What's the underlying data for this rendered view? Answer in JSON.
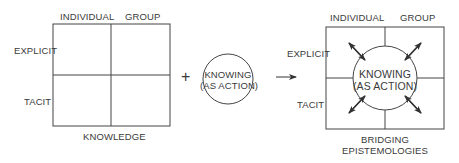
{
  "left_panel": {
    "col_labels": [
      "INDIVIDUAL",
      "GROUP"
    ],
    "row_labels": [
      "EXPLICIT",
      "TACIT"
    ],
    "caption": "KNOWLEDGE"
  },
  "operator": "+",
  "middle_panel": {
    "circle_line1": "KNOWING",
    "circle_line2": "(AS ACTION)"
  },
  "arrow": "→",
  "right_panel": {
    "col_labels": [
      "INDIVIDUAL",
      "GROUP"
    ],
    "row_labels": [
      "EXPLICIT",
      "TACIT"
    ],
    "circle_line1": "KNOWING",
    "circle_line2": "(AS ACTION)",
    "caption_line1": "BRIDGING",
    "caption_line2": "EPISTEMOLOGIES"
  },
  "colors": {
    "line": "#444444",
    "text": "#3a3a3a"
  }
}
